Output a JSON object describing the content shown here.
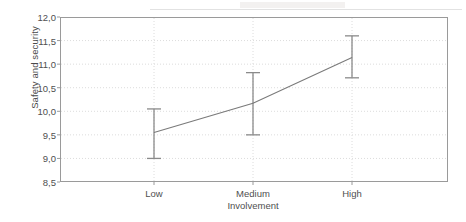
{
  "chart_data": {
    "type": "line",
    "title": "",
    "subtitle": "",
    "xlabel": "Involvement",
    "ylabel": "Safety and security",
    "categories": [
      "Low",
      "Medium",
      "High"
    ],
    "values": [
      9.55,
      10.17,
      11.14
    ],
    "series": [
      {
        "name": "Safety and security",
        "values": [
          9.55,
          10.17,
          11.14
        ],
        "error_low": [
          9.0,
          9.5,
          10.71
        ],
        "error_high": [
          10.05,
          10.82,
          11.6
        ]
      }
    ],
    "error_bar_type": "confidence-interval",
    "ylim": [
      8.5,
      12.0
    ],
    "ytick_step": 0.5,
    "ytick_labels": [
      "8,5",
      "9,0",
      "9,5",
      "10,0",
      "10,5",
      "11,0",
      "11,5",
      "12,0"
    ],
    "ytick_values": [
      8.5,
      9.0,
      9.5,
      10.0,
      10.5,
      11.0,
      11.5,
      12.0
    ],
    "xtick_labels": [
      "Low",
      "Medium",
      "High"
    ],
    "grid": {
      "horizontal": true,
      "vertical": true,
      "style": "dotted",
      "color": "#dcdcdc"
    },
    "legend": {
      "visible": false,
      "position": "none",
      "entries": []
    },
    "colors": {
      "line": "#7a7a7a",
      "error_bar": "#8a8a8a",
      "frame": "#9a9a9a",
      "grid": "#dcdcdc",
      "background": "#ffffff",
      "text": "#4f4f4f"
    },
    "decimal_separator": ","
  }
}
